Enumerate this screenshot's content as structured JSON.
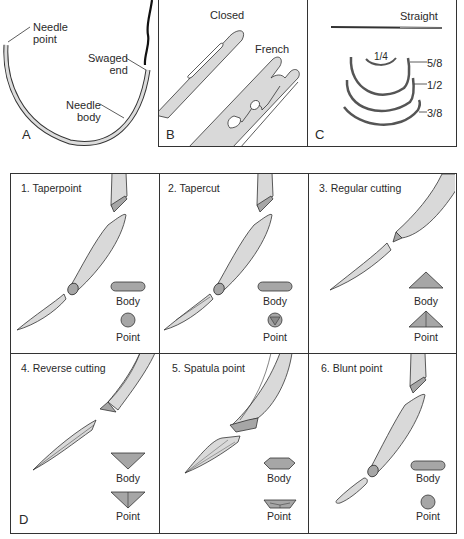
{
  "figure": {
    "panel_a": {
      "letter": "A",
      "labels": {
        "needle_point": [
          "Needle",
          "point"
        ],
        "swaged_end": [
          "Swaged",
          "end"
        ],
        "needle_body": [
          "Needle",
          "body"
        ]
      }
    },
    "panel_b": {
      "letter": "B",
      "eye_types": [
        "Closed",
        "French"
      ]
    },
    "panel_c": {
      "letter": "C",
      "curvatures": [
        "Straight",
        "1/4",
        "5/8",
        "1/2",
        "3/8"
      ]
    },
    "panel_d": {
      "letter": "D",
      "cross_section_labels": {
        "body": "Body",
        "point": "Point"
      },
      "needle_types": [
        {
          "title": "1.  Taperpoint",
          "body_shape": "rounded-flat",
          "point_shape": "circle"
        },
        {
          "title": "2.  Tapercut",
          "body_shape": "rounded-flat",
          "point_shape": "circle-with-triangle"
        },
        {
          "title": "3.  Regular cutting",
          "body_shape": "triangle-up",
          "point_shape": "triangle-up-with-ridge"
        },
        {
          "title": "4.  Reverse cutting",
          "body_shape": "triangle-down",
          "point_shape": "triangle-down-with-ridge"
        },
        {
          "title": "5.  Spatula point",
          "body_shape": "hexagon-flat",
          "point_shape": "trapezoid"
        },
        {
          "title": "6.  Blunt point",
          "body_shape": "rounded-flat",
          "point_shape": "circle"
        }
      ]
    },
    "colors": {
      "needle_fill": "#d9d9d9",
      "cross_section_fill": "#a6a6a6",
      "outline": "#333333",
      "suture": "#111111"
    }
  }
}
